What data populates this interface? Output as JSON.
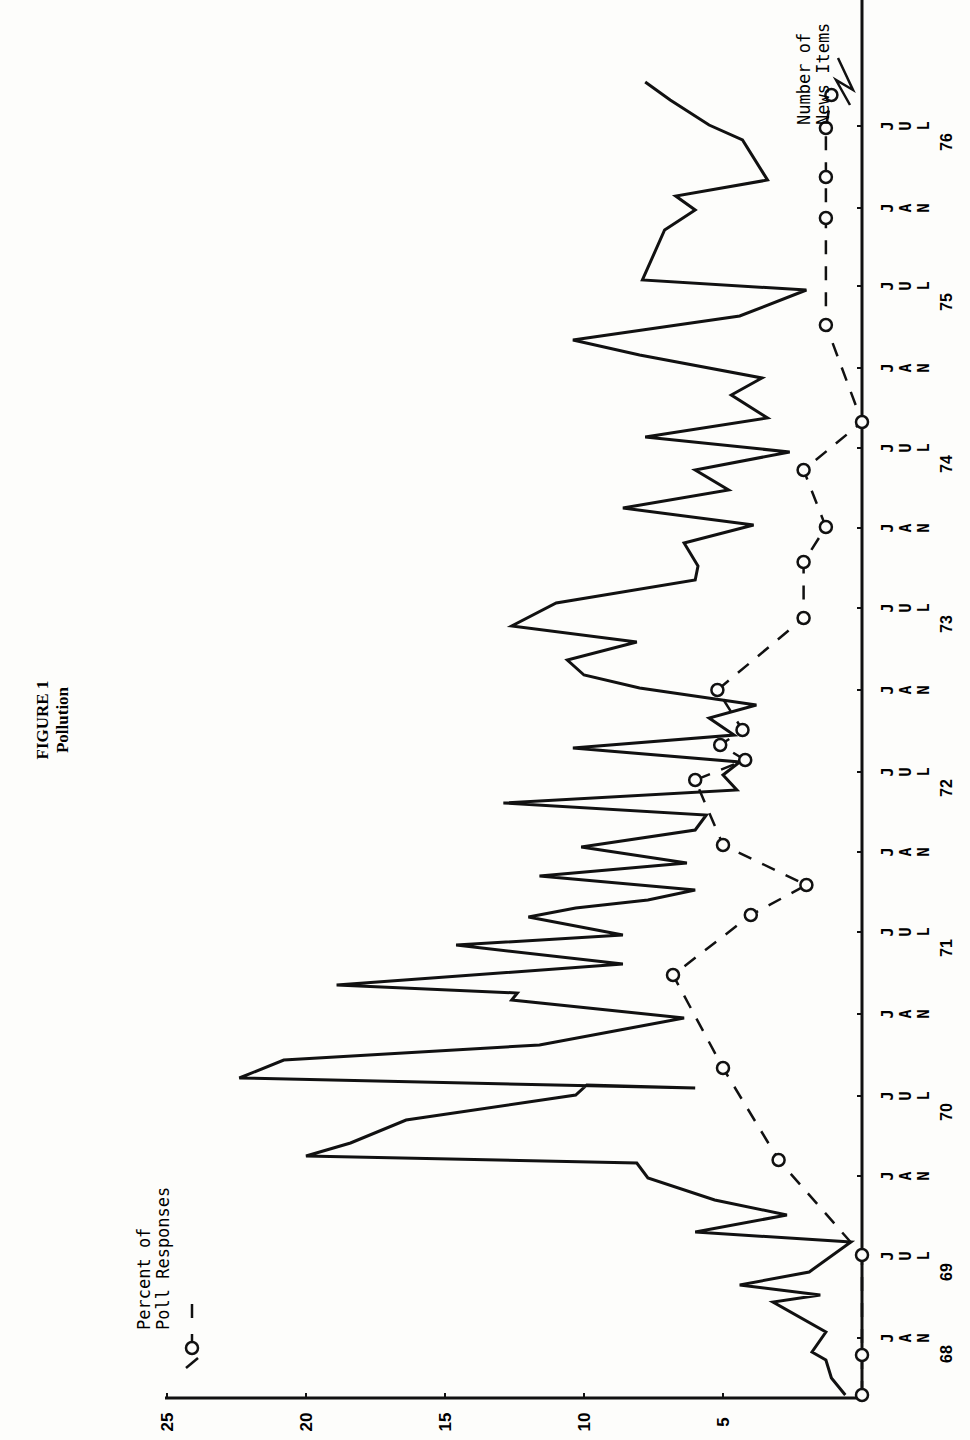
{
  "figure": {
    "title": "FIGURE 1",
    "subtitle": "Pollution"
  },
  "legend": {
    "poll": {
      "line1": "Percent of",
      "line2": "Poll Responses",
      "style": "dashed line with open circles"
    },
    "news": {
      "line1": "Number of",
      "line2": "News Items",
      "style": "solid line"
    }
  },
  "axes": {
    "value_ticks": [
      "25",
      "20",
      "15",
      "10",
      "5"
    ],
    "time_labels": [
      {
        "month": "JAN",
        "year": "68",
        "y": 1330
      },
      {
        "month": "JUL",
        "year": "69",
        "y": 1248
      },
      {
        "month": "JAN",
        "year": "",
        "y": 1168
      },
      {
        "month": "JUL",
        "year": "70",
        "y": 1088
      },
      {
        "month": "JAN",
        "year": "",
        "y": 1006
      },
      {
        "month": "JUL",
        "year": "71",
        "y": 924
      },
      {
        "month": "JAN",
        "year": "",
        "y": 844
      },
      {
        "month": "JUL",
        "year": "72",
        "y": 764
      },
      {
        "month": "JAN",
        "year": "",
        "y": 682
      },
      {
        "month": "JUL",
        "year": "73",
        "y": 600
      },
      {
        "month": "JAN",
        "year": "",
        "y": 520
      },
      {
        "month": "JUL",
        "year": "74",
        "y": 440
      },
      {
        "month": "JAN",
        "year": "",
        "y": 360
      },
      {
        "month": "JUL",
        "year": "75",
        "y": 278
      },
      {
        "month": "JAN",
        "year": "",
        "y": 200
      },
      {
        "month": "JUL",
        "year": "76",
        "y": 118
      }
    ]
  },
  "colors": {
    "ink": "#111111",
    "paper": "#fdfdfb"
  },
  "chart_data": {
    "type": "line",
    "title": "FIGURE 1 Pollution",
    "orientation": "rotated 90° counter-clockwise (time runs bottom-to-top along right edge; values run right-to-left along bottom edge)",
    "xlabel": "Date (JAN 1968 – JUL 1976)",
    "ylabel": "Number of News Items / Percent of Poll Responses",
    "ylim": [
      0,
      25
    ],
    "yticks": [
      5,
      10,
      15,
      20,
      25
    ],
    "grid": false,
    "legend_position": "inline labels at chart corners",
    "x_tick_labels": [
      "JAN 68",
      "JUL 69",
      "JAN",
      "JUL 70",
      "JAN",
      "JUL 71",
      "JAN",
      "JUL 72",
      "JAN",
      "JUL 73",
      "JAN",
      "JUL 74",
      "JAN",
      "JUL 75",
      "JAN",
      "JUL 76"
    ],
    "series": [
      {
        "name": "Number of News Items",
        "style": "solid",
        "points": [
          {
            "y_px": 1395,
            "value": 0.6
          },
          {
            "y_px": 1378,
            "value": 1.1
          },
          {
            "y_px": 1360,
            "value": 1.3
          },
          {
            "y_px": 1352,
            "value": 1.8
          },
          {
            "y_px": 1332,
            "value": 1.3
          },
          {
            "y_px": 1302,
            "value": 3.2
          },
          {
            "y_px": 1295,
            "value": 1.5
          },
          {
            "y_px": 1285,
            "value": 4.4
          },
          {
            "y_px": 1272,
            "value": 1.9
          },
          {
            "y_px": 1242,
            "value": 0.4
          },
          {
            "y_px": 1232,
            "value": 6.0
          },
          {
            "y_px": 1215,
            "value": 2.7
          },
          {
            "y_px": 1200,
            "value": 5.3
          },
          {
            "y_px": 1178,
            "value": 7.7
          },
          {
            "y_px": 1163,
            "value": 8.1
          },
          {
            "y_px": 1156,
            "value": 20.0
          },
          {
            "y_px": 1143,
            "value": 18.4
          },
          {
            "y_px": 1120,
            "value": 16.4
          },
          {
            "y_px": 1095,
            "value": 10.3
          },
          {
            "y_px": 1085,
            "value": 9.9
          },
          {
            "y_px": 1088,
            "value": 6.0
          },
          {
            "y_px": 1078,
            "value": 22.4
          },
          {
            "y_px": 1060,
            "value": 20.8
          },
          {
            "y_px": 1045,
            "value": 11.6
          },
          {
            "y_px": 1018,
            "value": 6.4
          },
          {
            "y_px": 1000,
            "value": 12.6
          },
          {
            "y_px": 993,
            "value": 12.4
          },
          {
            "y_px": 985,
            "value": 18.9
          },
          {
            "y_px": 964,
            "value": 8.6
          },
          {
            "y_px": 945,
            "value": 14.6
          },
          {
            "y_px": 935,
            "value": 8.6
          },
          {
            "y_px": 917,
            "value": 12.0
          },
          {
            "y_px": 908,
            "value": 10.3
          },
          {
            "y_px": 900,
            "value": 7.7
          },
          {
            "y_px": 890,
            "value": 6.0
          },
          {
            "y_px": 876,
            "value": 11.6
          },
          {
            "y_px": 863,
            "value": 6.3
          },
          {
            "y_px": 847,
            "value": 10.1
          },
          {
            "y_px": 830,
            "value": 6.0
          },
          {
            "y_px": 815,
            "value": 5.6
          },
          {
            "y_px": 803,
            "value": 12.9
          },
          {
            "y_px": 790,
            "value": 4.5
          },
          {
            "y_px": 775,
            "value": 5.0
          },
          {
            "y_px": 762,
            "value": 4.4
          },
          {
            "y_px": 748,
            "value": 10.4
          },
          {
            "y_px": 735,
            "value": 4.6
          },
          {
            "y_px": 718,
            "value": 5.5
          },
          {
            "y_px": 705,
            "value": 3.8
          },
          {
            "y_px": 688,
            "value": 8.0
          },
          {
            "y_px": 675,
            "value": 10.0
          },
          {
            "y_px": 660,
            "value": 10.6
          },
          {
            "y_px": 642,
            "value": 8.1
          },
          {
            "y_px": 626,
            "value": 12.6
          },
          {
            "y_px": 603,
            "value": 11.0
          },
          {
            "y_px": 580,
            "value": 6.0
          },
          {
            "y_px": 566,
            "value": 5.9
          },
          {
            "y_px": 543,
            "value": 6.4
          },
          {
            "y_px": 525,
            "value": 3.9
          },
          {
            "y_px": 508,
            "value": 8.6
          },
          {
            "y_px": 490,
            "value": 4.8
          },
          {
            "y_px": 470,
            "value": 6.0
          },
          {
            "y_px": 452,
            "value": 2.6
          },
          {
            "y_px": 437,
            "value": 7.8
          },
          {
            "y_px": 418,
            "value": 3.4
          },
          {
            "y_px": 395,
            "value": 4.7
          },
          {
            "y_px": 378,
            "value": 3.6
          },
          {
            "y_px": 355,
            "value": 8.0
          },
          {
            "y_px": 340,
            "value": 10.4
          },
          {
            "y_px": 330,
            "value": 7.9
          },
          {
            "y_px": 316,
            "value": 4.4
          },
          {
            "y_px": 290,
            "value": 2.0
          },
          {
            "y_px": 280,
            "value": 7.9
          },
          {
            "y_px": 230,
            "value": 7.1
          },
          {
            "y_px": 210,
            "value": 6.0
          },
          {
            "y_px": 196,
            "value": 6.7
          },
          {
            "y_px": 180,
            "value": 3.4
          },
          {
            "y_px": 140,
            "value": 4.3
          },
          {
            "y_px": 125,
            "value": 5.5
          },
          {
            "y_px": 100,
            "value": 6.9
          },
          {
            "y_px": 82,
            "value": 7.8
          }
        ]
      },
      {
        "name": "Percent of Poll Responses",
        "style": "dashed with open circles",
        "points": [
          {
            "label": "1968 early",
            "y_px": 1395,
            "value": 0
          },
          {
            "label": "JAN 68",
            "y_px": 1355,
            "value": 0
          },
          {
            "label": "JUL 69",
            "y_px": 1255,
            "value": 0
          },
          {
            "label": "JAN 70",
            "y_px": 1160,
            "value": 3.0
          },
          {
            "label": "mid 70",
            "y_px": 1068,
            "value": 5.0
          },
          {
            "label": "late 70",
            "y_px": 975,
            "value": 6.8
          },
          {
            "label": "mid 71",
            "y_px": 915,
            "value": 4.0
          },
          {
            "label": "JUL 71",
            "y_px": 885,
            "value": 2.0
          },
          {
            "label": "late 71",
            "y_px": 845,
            "value": 5.0
          },
          {
            "label": "JAN 72",
            "y_px": 780,
            "value": 6.0
          },
          {
            "label": "72 a",
            "y_px": 760,
            "value": 4.2
          },
          {
            "label": "72 b",
            "y_px": 745,
            "value": 5.1
          },
          {
            "label": "72 c",
            "y_px": 730,
            "value": 4.3
          },
          {
            "label": "JAN 73",
            "y_px": 690,
            "value": 5.2
          },
          {
            "label": "JUL 73",
            "y_px": 618,
            "value": 2.1
          },
          {
            "label": "73 late",
            "y_px": 562,
            "value": 2.1
          },
          {
            "label": "JAN 74",
            "y_px": 527,
            "value": 1.3
          },
          {
            "label": "74 mid",
            "y_px": 470,
            "value": 2.1
          },
          {
            "label": "JUL 74",
            "y_px": 422,
            "value": 0
          },
          {
            "label": "JAN 75",
            "y_px": 325,
            "value": 1.3
          },
          {
            "label": "JUL 75",
            "y_px": 218,
            "value": 1.3
          },
          {
            "label": "75 late",
            "y_px": 177,
            "value": 1.3
          },
          {
            "label": "JAN 76",
            "y_px": 128,
            "value": 1.3
          },
          {
            "label": "76",
            "y_px": 95,
            "value": 1.1
          }
        ]
      }
    ],
    "axis_mapping": {
      "value_zero_x": 862,
      "px_per_unit": 27.8,
      "axis_line_y": 1398
    }
  }
}
